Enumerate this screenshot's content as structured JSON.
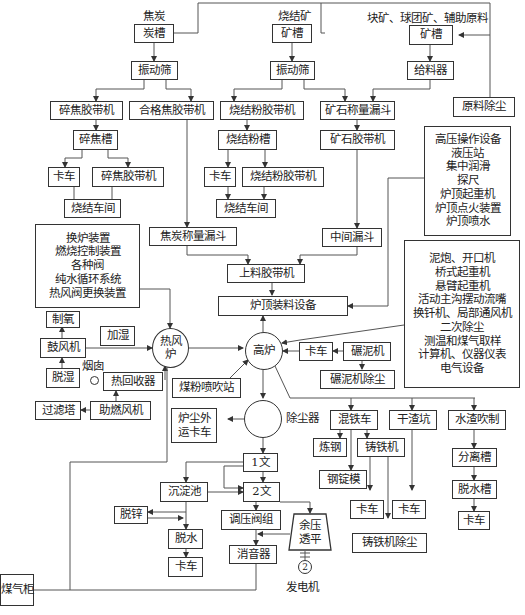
{
  "labels": {
    "coke": "焦炭",
    "sinter": "烧结矿",
    "lump_ore": "块矿、球团矿、辅助原料",
    "chimney": "烟囱",
    "dust_collector": "除尘器",
    "generator": "发电机",
    "generator_num": "2"
  },
  "boxes": {
    "coke_bin": "炭槽",
    "coke_screen": "振动筛",
    "crushed_coke_belt": "碎焦胶带机",
    "qualified_coke_belt": "合格焦胶带机",
    "crushed_coke_bin": "碎焦槽",
    "truck1": "卡车",
    "crushed_coke_belt2": "碎焦胶带机",
    "sinter_shop1": "烧结车间",
    "sinter_bin": "矿槽",
    "sinter_screen": "振动筛",
    "sinter_fines_belt": "烧结粉胶带机",
    "sinter_fines_bin": "烧结粉槽",
    "truck2": "卡车",
    "sinter_fines_belt2": "烧结粉胶带机",
    "sinter_shop2": "烧结车间",
    "ore_weigh_hopper": "矿石称量漏斗",
    "ore_belt": "矿石胶带机",
    "lump_bin": "矿槽",
    "feeder": "给料器",
    "raw_dust": "原料除尘",
    "coke_weigh_hopper": "焦炭称量漏斗",
    "mid_hopper": "中间漏斗",
    "charging_belt": "上料胶带机",
    "top_charging": "炉顶装料设备",
    "oxygen": "制氧",
    "blower": "鼓风机",
    "humidify": "加湿",
    "dehumidify": "脱湿",
    "heat_recovery": "热回收器",
    "filter_tower": "过滤塔",
    "combustion_fan": "助燃风机",
    "coal_injection": "煤粉喷吹站",
    "truck3": "卡车",
    "mud_mill": "碾泥机",
    "mud_mill_dust": "碾泥机除尘",
    "dust_truck": "炉尘外运卡车",
    "torpedo": "混铁车",
    "dry_slag_pit": "干渣坑",
    "water_slag": "水渣吹制",
    "steelmaking": "炼钢",
    "pig_caster": "铸铁机",
    "ingot_mold": "钢锭模",
    "truck4": "卡车",
    "truck5": "卡车",
    "caster_dust": "铸铁机除尘",
    "separator": "分离槽",
    "dewater_tank": "脱水槽",
    "truck6": "卡车",
    "venturi1": "1文",
    "venturi2": "2文",
    "settling": "沉淀池",
    "dezinc": "脱锌",
    "dewater": "脱水",
    "truck7": "卡车",
    "pressure_valve": "调压阀组",
    "muffler": "消音器",
    "trt": "余压透平",
    "gas_holder": "煤气柜"
  },
  "circles": {
    "hot_stove": [
      "热风",
      "炉"
    ],
    "blast_furnace": "高炉"
  },
  "lists": {
    "top_equipment": [
      "高压操作设备",
      "液压站",
      "集中润滑",
      "探尺",
      "炉顶起重机",
      "炉顶点火装置",
      "炉顶喷水"
    ],
    "stove_equipment": [
      "换炉装置",
      "燃烧控制装置",
      "各种阀",
      "纯水循环系统",
      "热风阀更换装置"
    ],
    "casthouse_equipment": [
      "泥炮、开口机",
      "桥式起重机",
      "悬臂起重机",
      "活动主沟摆动流嘴",
      "换钎机、局部通风机",
      "二次除尘",
      "测温和煤气取样",
      "计算机、仪器仪表",
      "电气设备"
    ]
  }
}
